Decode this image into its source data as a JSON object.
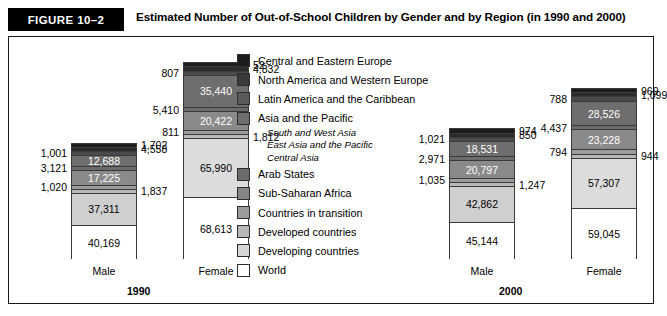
{
  "header": {
    "figure_tag": "FIGURE 10–2",
    "title": "Estimated Number of Out-of-School Children by Gender and by Region (in 1990 and 2000)"
  },
  "legend": {
    "items": [
      {
        "label": "Central and Eastern Europe",
        "color": "#1c1c1c"
      },
      {
        "label": "North America and Western Europe",
        "color": "#3a3a3a"
      },
      {
        "label": "Latin America and the Caribbean",
        "color": "#5a5a5a"
      },
      {
        "label": "Asia and the Pacific",
        "color": "#6e6e6e"
      },
      {
        "label": "Arab States",
        "color": "#6b6b6b"
      },
      {
        "label": "Sub-Saharan Africa",
        "color": "#858585"
      },
      {
        "label": "Countries in transition",
        "color": "#9c9c9c"
      },
      {
        "label": "Developed countries",
        "color": "#b8b8b8"
      },
      {
        "label": "Developing countries",
        "color": "#d6d6d6"
      },
      {
        "label": "World",
        "color": "#ffffff"
      }
    ],
    "sub_items": [
      "South and West Asia",
      "East Asia and the Pacific",
      "Central Asia"
    ]
  },
  "chart_data": {
    "type": "bar",
    "title": "Estimated Number of Out-of-School Children by Gender and by Region (in 1990 and 2000)",
    "xlabel": "",
    "ylabel": "",
    "stacked": true,
    "units": "thousands",
    "legend_position": "center",
    "grid": false,
    "groups": [
      {
        "year": "1990",
        "bars": [
          {
            "category": "Male",
            "segments": [
              {
                "series": "Central and Eastern Europe",
                "value": 1702,
                "label": "1,702",
                "label_pos": "right",
                "color": "#1c1c1c"
              },
              {
                "series": "North America and Western Europe",
                "value": 4558,
                "label": "4,558",
                "label_pos": "right",
                "color": "#2b2b2b"
              },
              {
                "series": "Latin America and the Caribbean",
                "value": 1001,
                "label": "1,001",
                "label_pos": "left",
                "color": "#4a4a4a"
              },
              {
                "series": "Asia and the Pacific",
                "value": 12688,
                "label": "12,688",
                "label_pos": "inside",
                "color": "#6e6e6e"
              },
              {
                "series": "Arab States",
                "value": 3121,
                "label": "3,121",
                "label_pos": "left",
                "color": "#6b6b6b"
              },
              {
                "series": "Sub-Saharan Africa",
                "value": 17225,
                "label": "17,225",
                "label_pos": "inside",
                "color": "#8a8a8a"
              },
              {
                "series": "Countries in transition",
                "value": 1020,
                "label": "1,020",
                "label_pos": "left",
                "color": "#9c9c9c"
              },
              {
                "series": "Developed countries",
                "value": 1837,
                "label": "1,837",
                "label_pos": "right",
                "color": "#b8b8b8"
              },
              {
                "series": "Developing countries",
                "value": 37311,
                "label": "37,311",
                "label_pos": "inside",
                "color": "#cfcfcf"
              },
              {
                "series": "World",
                "value": 40169,
                "label": "40,169",
                "label_pos": "inside",
                "color": "#ffffff"
              }
            ]
          },
          {
            "category": "Female",
            "segments": [
              {
                "series": "Central and Eastern Europe",
                "value": 52,
                "label": "52",
                "label_pos": "right",
                "color": "#1c1c1c"
              },
              {
                "series": "North America and Western Europe",
                "value": 4832,
                "label": "4,832",
                "label_pos": "right",
                "color": "#2b2b2b"
              },
              {
                "series": "Latin America and the Caribbean",
                "value": 807,
                "label": "807",
                "label_pos": "left",
                "color": "#4a4a4a"
              },
              {
                "series": "Asia and the Pacific",
                "value": 35440,
                "label": "35,440",
                "label_pos": "inside",
                "color": "#6e6e6e"
              },
              {
                "series": "Arab States",
                "value": 5410,
                "label": "5,410",
                "label_pos": "left",
                "color": "#6b6b6b"
              },
              {
                "series": "Sub-Saharan Africa",
                "value": 20422,
                "label": "20,422",
                "label_pos": "inside",
                "color": "#8a8a8a"
              },
              {
                "series": "Countries in transition",
                "value": 811,
                "label": "811",
                "label_pos": "left",
                "color": "#9c9c9c"
              },
              {
                "series": "Developed countries",
                "value": 1812,
                "label": "1,812",
                "label_pos": "right",
                "color": "#b8b8b8"
              },
              {
                "series": "Developing countries",
                "value": 65990,
                "label": "65,990",
                "label_pos": "inside",
                "color": "#dcdcdc"
              },
              {
                "series": "World",
                "value": 68613,
                "label": "68,613",
                "label_pos": "inside",
                "color": "#ffffff"
              }
            ]
          }
        ]
      },
      {
        "year": "2000",
        "bars": [
          {
            "category": "Male",
            "segments": [
              {
                "series": "Central and Eastern Europe",
                "value": 974,
                "label": "974",
                "label_pos": "right",
                "color": "#1c1c1c"
              },
              {
                "series": "North America and Western Europe",
                "value": 850,
                "label": "850",
                "label_pos": "right",
                "color": "#2b2b2b"
              },
              {
                "series": "Latin America and the Caribbean",
                "value": 1021,
                "label": "1,021",
                "label_pos": "left",
                "color": "#4a4a4a"
              },
              {
                "series": "Asia and the Pacific",
                "value": 18531,
                "label": "18,531",
                "label_pos": "inside",
                "color": "#6e6e6e"
              },
              {
                "series": "Arab States",
                "value": 2971,
                "label": "2,971",
                "label_pos": "left",
                "color": "#6b6b6b"
              },
              {
                "series": "Sub-Saharan Africa",
                "value": 20797,
                "label": "20,797",
                "label_pos": "inside",
                "color": "#8a8a8a"
              },
              {
                "series": "Countries in transition",
                "value": 1035,
                "label": "1,035",
                "label_pos": "left",
                "color": "#9c9c9c"
              },
              {
                "series": "Developed countries",
                "value": 1247,
                "label": "1,247",
                "label_pos": "right",
                "color": "#b8b8b8"
              },
              {
                "series": "Developing countries",
                "value": 42862,
                "label": "42,862",
                "label_pos": "inside",
                "color": "#cfcfcf"
              },
              {
                "series": "World",
                "value": 45144,
                "label": "45,144",
                "label_pos": "inside",
                "color": "#ffffff"
              }
            ]
          },
          {
            "category": "Female",
            "segments": [
              {
                "series": "Central and Eastern Europe",
                "value": 969,
                "label": "969",
                "label_pos": "right",
                "color": "#1c1c1c"
              },
              {
                "series": "North America and Western Europe",
                "value": 1099,
                "label": "1,099",
                "label_pos": "right",
                "color": "#2b2b2b"
              },
              {
                "series": "Latin America and the Caribbean",
                "value": 788,
                "label": "788",
                "label_pos": "left",
                "color": "#4a4a4a"
              },
              {
                "series": "Asia and the Pacific",
                "value": 28526,
                "label": "28,526",
                "label_pos": "inside",
                "color": "#6e6e6e"
              },
              {
                "series": "Arab States",
                "value": 4437,
                "label": "4,437",
                "label_pos": "left",
                "color": "#6b6b6b"
              },
              {
                "series": "Sub-Saharan Africa",
                "value": 23228,
                "label": "23,228",
                "label_pos": "inside",
                "color": "#8a8a8a"
              },
              {
                "series": "Countries in transition",
                "value": 794,
                "label": "794",
                "label_pos": "left",
                "color": "#9c9c9c"
              },
              {
                "series": "Developed countries",
                "value": 944,
                "label": "944",
                "label_pos": "right",
                "color": "#b8b8b8"
              },
              {
                "series": "Developing countries",
                "value": 57307,
                "label": "57,307",
                "label_pos": "inside",
                "color": "#dcdcdc"
              },
              {
                "series": "World",
                "value": 59045,
                "label": "59,045",
                "label_pos": "inside",
                "color": "#ffffff"
              }
            ]
          }
        ]
      }
    ]
  }
}
